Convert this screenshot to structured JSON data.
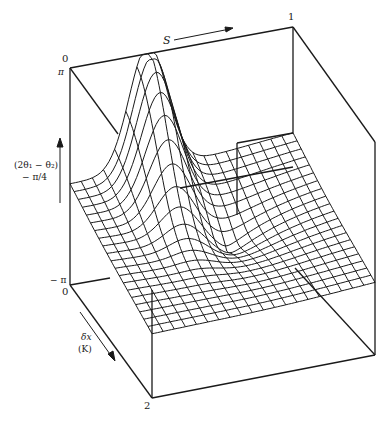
{
  "chart_data": {
    "type": "surface-wireframe",
    "title": "",
    "axes": {
      "s": {
        "label": "S",
        "range": [
          0,
          1
        ],
        "tick_labels": [
          "0",
          "1"
        ],
        "direction": "right"
      },
      "dx": {
        "label_line1": "δx",
        "label_line2": "(K)",
        "range": [
          0,
          2
        ],
        "tick_labels": [
          "0",
          "2"
        ],
        "direction": "down-right"
      },
      "z": {
        "label_line1": "(2θ₁ − θ₂)",
        "label_line2": "− π/4",
        "range": [
          -3.1416,
          3.1416
        ],
        "tick_labels": [
          "π",
          "− π"
        ],
        "direction": "up"
      }
    },
    "grid": {
      "s_lines": 20,
      "dx_lines": 20
    },
    "features": [
      {
        "name": "ridge",
        "description": "tall ridge rising to +π near S≈0.35, δx≈0"
      },
      {
        "name": "singularity",
        "description": "converging fan of grid lines near S≈0.55, δx≈0.9"
      },
      {
        "name": "step",
        "description": "vertical discontinuity wall near S≈0.6 at back edge"
      }
    ],
    "colors": {
      "line": "#1a1a1a",
      "background": "#ffffff"
    }
  }
}
